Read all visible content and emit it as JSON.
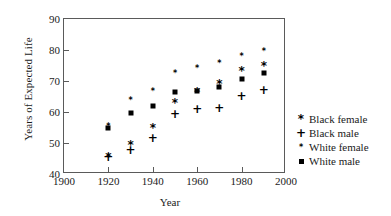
{
  "chart_data": {
    "type": "scatter",
    "title": "",
    "xlabel": "Year",
    "ylabel": "Years of Expected Life",
    "xlim": [
      1900,
      2000
    ],
    "ylim": [
      40,
      90
    ],
    "xticks": [
      1900,
      1920,
      1940,
      1960,
      1980,
      2000
    ],
    "yticks": [
      40,
      50,
      60,
      70,
      80,
      90
    ],
    "grid": false,
    "legend_position": "right",
    "x": [
      1920,
      1930,
      1940,
      1950,
      1960,
      1970,
      1980,
      1990
    ],
    "series": [
      {
        "name": "Black female",
        "marker": "*",
        "marker_name": "asterisk-large",
        "x": [
          1920,
          1930,
          1940,
          1950,
          1960,
          1970,
          1980,
          1990
        ],
        "values": [
          45.5,
          49.5,
          55.0,
          62.8,
          66.5,
          69.0,
          73.3,
          75.0
        ]
      },
      {
        "name": "Black male",
        "marker": "+",
        "marker_name": "plus",
        "x": [
          1920,
          1930,
          1940,
          1950,
          1960,
          1970,
          1980,
          1990
        ],
        "values": [
          45.5,
          47.8,
          51.6,
          59.2,
          61.1,
          61.2,
          65.2,
          67.0
        ]
      },
      {
        "name": "White female",
        "marker": "*",
        "marker_name": "asterisk-small",
        "x": [
          1920,
          1930,
          1940,
          1950,
          1960,
          1970,
          1980,
          1990
        ],
        "values": [
          55.3,
          63.6,
          66.6,
          72.1,
          73.8,
          75.5,
          77.9,
          79.3
        ]
      },
      {
        "name": "White male",
        "marker": "■",
        "marker_name": "filled-square",
        "x": [
          1920,
          1930,
          1940,
          1950,
          1960,
          1970,
          1980,
          1990
        ],
        "values": [
          54.7,
          59.8,
          62.0,
          66.5,
          66.7,
          68.0,
          70.5,
          72.6
        ]
      }
    ]
  },
  "legend": {
    "items": [
      {
        "symbol": "*",
        "label": "Black female",
        "class": "s-bf"
      },
      {
        "symbol": "+",
        "label": "Black male",
        "class": "s-bm"
      },
      {
        "symbol": "*",
        "label": "White female",
        "class": "s-wf"
      },
      {
        "symbol": "",
        "label": "White male",
        "class": "s-wm"
      }
    ]
  },
  "colors": {
    "marker": "#000000",
    "axis": "#5a5a5a",
    "text": "#1a1a1a",
    "background": "#ffffff"
  }
}
